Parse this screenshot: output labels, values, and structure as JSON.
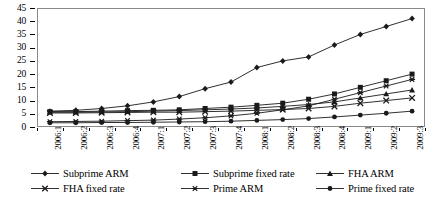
{
  "chart_data": {
    "type": "line",
    "title": "",
    "xlabel": "",
    "ylabel": "",
    "ylim": [
      0,
      45
    ],
    "ytick_step": 5,
    "yticks": [
      45,
      40,
      35,
      30,
      25,
      20,
      15,
      10,
      5,
      0
    ],
    "grid": false,
    "legend_position": "bottom",
    "categories": [
      "2006:1",
      "2006:2",
      "2006:3",
      "2006:4",
      "2007:1",
      "2007:2",
      "2007:3",
      "2007:4",
      "2008:1",
      "2008:2",
      "2008:3",
      "2008:4",
      "2009:1",
      "2009:2",
      "2009:3"
    ],
    "series": [
      {
        "name": "Subprime ARM",
        "marker": "diamond",
        "values": [
          6.0,
          6.3,
          7.0,
          8.0,
          9.5,
          11.5,
          14.5,
          17.0,
          22.5,
          25.0,
          26.5,
          31.0,
          35.0,
          38.0,
          41.0
        ]
      },
      {
        "name": "Subprime fixed rate",
        "marker": "square",
        "values": [
          5.8,
          5.8,
          6.0,
          6.2,
          6.3,
          6.5,
          7.0,
          7.5,
          8.2,
          9.0,
          10.5,
          12.5,
          15.0,
          17.5,
          20.0
        ]
      },
      {
        "name": "FHA ARM",
        "marker": "triangle",
        "values": [
          5.6,
          5.6,
          5.7,
          5.8,
          6.0,
          6.2,
          6.5,
          6.8,
          7.2,
          7.8,
          8.5,
          9.5,
          11.0,
          12.5,
          14.0
        ]
      },
      {
        "name": "FHA fixed rate",
        "marker": "cross",
        "values": [
          5.3,
          5.3,
          5.4,
          5.5,
          5.6,
          5.6,
          5.8,
          6.0,
          6.3,
          6.6,
          7.0,
          7.8,
          9.0,
          10.0,
          11.0
        ]
      },
      {
        "name": "Prime ARM",
        "marker": "star",
        "values": [
          2.0,
          2.1,
          2.2,
          2.4,
          2.6,
          3.0,
          3.5,
          4.2,
          5.2,
          6.5,
          8.0,
          10.5,
          13.0,
          15.5,
          18.0
        ]
      },
      {
        "name": "Prime fixed rate",
        "marker": "circle",
        "values": [
          1.6,
          1.6,
          1.7,
          1.7,
          1.8,
          1.9,
          2.0,
          2.2,
          2.5,
          2.8,
          3.2,
          3.8,
          4.5,
          5.2,
          6.0
        ]
      }
    ]
  },
  "legend": {
    "items": [
      {
        "label": "Subprime ARM",
        "marker": "diamond"
      },
      {
        "label": "Subprime fixed rate",
        "marker": "square"
      },
      {
        "label": "FHA ARM",
        "marker": "triangle"
      },
      {
        "label": "FHA fixed rate",
        "marker": "cross"
      },
      {
        "label": "Prime ARM",
        "marker": "star"
      },
      {
        "label": "Prime fixed rate",
        "marker": "circle"
      }
    ]
  },
  "colors": {
    "line": "#1a1a1a",
    "frame": "#8a8a8a",
    "background": "#ffffff"
  }
}
